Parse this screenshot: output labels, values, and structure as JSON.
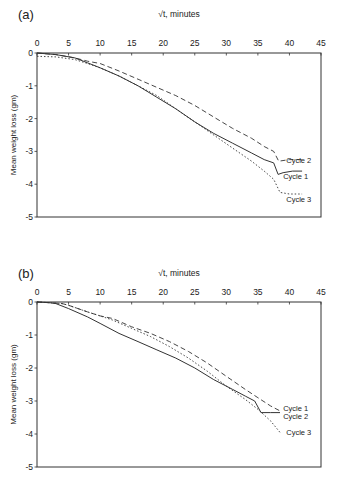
{
  "chart_data": [
    {
      "type": "line",
      "panel_label": "(a)",
      "title": "",
      "xlabel": "√t, minutes",
      "ylabel": "Mean weight loss (gm)",
      "xlim": [
        0,
        45
      ],
      "ylim": [
        -5,
        0
      ],
      "x_ticks": [
        0,
        5,
        10,
        15,
        20,
        25,
        30,
        35,
        40,
        45
      ],
      "y_ticks": [
        0,
        -1,
        -2,
        -3,
        -4,
        -5
      ],
      "x_axis_position": "top",
      "grid": false,
      "legend": "inline labels at right",
      "series": [
        {
          "name": "Cycle 1",
          "style": "solid",
          "x": [
            0,
            3,
            6,
            8,
            10,
            13,
            16,
            19,
            22,
            25,
            28,
            31,
            34,
            36,
            37.5,
            38.2,
            39,
            40.5,
            42
          ],
          "y": [
            0,
            -0.05,
            -0.15,
            -0.3,
            -0.45,
            -0.7,
            -1.0,
            -1.35,
            -1.7,
            -2.1,
            -2.45,
            -2.75,
            -3.05,
            -3.25,
            -3.35,
            -3.7,
            -3.65,
            -3.6,
            -3.6
          ]
        },
        {
          "name": "Cycle 2",
          "style": "dashed",
          "x": [
            0,
            3,
            6,
            8,
            10,
            13,
            16,
            19,
            22,
            25,
            28,
            31,
            34,
            36,
            37.5,
            38.3,
            40,
            42
          ],
          "y": [
            0,
            -0.05,
            -0.15,
            -0.25,
            -0.32,
            -0.55,
            -0.8,
            -1.05,
            -1.3,
            -1.6,
            -1.95,
            -2.3,
            -2.6,
            -2.85,
            -3.0,
            -3.3,
            -3.25,
            -3.25
          ]
        },
        {
          "name": "Cycle 3",
          "style": "dotted",
          "x": [
            0,
            3,
            6,
            8,
            10,
            13,
            16,
            19,
            22,
            25,
            28,
            31,
            34,
            36,
            37.5,
            38.5,
            40,
            42
          ],
          "y": [
            -0.1,
            -0.12,
            -0.2,
            -0.32,
            -0.45,
            -0.7,
            -1.0,
            -1.3,
            -1.7,
            -2.1,
            -2.5,
            -2.9,
            -3.3,
            -3.6,
            -3.85,
            -4.25,
            -4.3,
            -4.3
          ]
        }
      ],
      "annotations": [
        {
          "text": "Cycle 2",
          "x": 39.5,
          "y": -3.25
        },
        {
          "text": "Cycle 1",
          "x": 39.0,
          "y": -3.75
        },
        {
          "text": "Cycle 3",
          "x": 39.5,
          "y": -4.45
        }
      ]
    },
    {
      "type": "line",
      "panel_label": "(b)",
      "title": "",
      "xlabel": "√t, minutes",
      "ylabel": "Mean weight loss (gm)",
      "xlim": [
        0,
        45
      ],
      "ylim": [
        -5,
        0
      ],
      "x_ticks": [
        0,
        5,
        10,
        15,
        20,
        25,
        30,
        35,
        40,
        45
      ],
      "y_ticks": [
        0,
        -1,
        -2,
        -3,
        -4,
        -5
      ],
      "x_axis_position": "top",
      "grid": false,
      "legend": "inline labels at right",
      "series": [
        {
          "name": "Cycle 1",
          "style": "dashed",
          "x": [
            0,
            2,
            4,
            5,
            8,
            10,
            12,
            15,
            18,
            21,
            24,
            27,
            30,
            33,
            35,
            37,
            38.5
          ],
          "y": [
            0,
            -0.02,
            -0.05,
            -0.1,
            -0.3,
            -0.42,
            -0.5,
            -0.75,
            -0.95,
            -1.2,
            -1.5,
            -1.85,
            -2.25,
            -2.65,
            -2.9,
            -3.15,
            -3.3
          ]
        },
        {
          "name": "Cycle 2",
          "style": "solid",
          "x": [
            0,
            2,
            3,
            5,
            8,
            10,
            13,
            16,
            19,
            22,
            25,
            28,
            31,
            33,
            34.5,
            35.5,
            37,
            38.5
          ],
          "y": [
            0,
            -0.02,
            -0.05,
            -0.2,
            -0.45,
            -0.65,
            -0.95,
            -1.2,
            -1.45,
            -1.7,
            -2.0,
            -2.35,
            -2.65,
            -2.85,
            -3.0,
            -3.35,
            -3.35,
            -3.35
          ]
        },
        {
          "name": "Cycle 3",
          "style": "dotted",
          "x": [
            0,
            2,
            4,
            5,
            8,
            10,
            12,
            15,
            18,
            21,
            24,
            27,
            30,
            33,
            35,
            37,
            38.5
          ],
          "y": [
            0,
            -0.02,
            -0.05,
            -0.1,
            -0.3,
            -0.42,
            -0.55,
            -0.8,
            -1.05,
            -1.35,
            -1.7,
            -2.1,
            -2.55,
            -2.95,
            -3.25,
            -3.6,
            -3.95
          ]
        }
      ],
      "annotations": [
        {
          "text": "Cycle 1",
          "x": 39.0,
          "y": -3.2
        },
        {
          "text": "Cycle 2",
          "x": 39.0,
          "y": -3.45
        },
        {
          "text": "Cycle 3",
          "x": 39.5,
          "y": -3.95
        }
      ]
    }
  ]
}
